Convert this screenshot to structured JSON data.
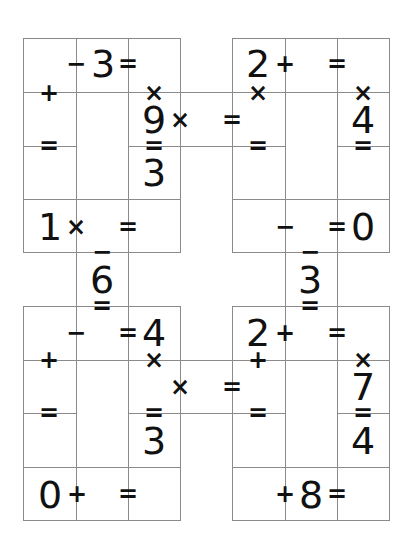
{
  "puzzle": {
    "type": "cross-math",
    "line_color": "#8a8a8a",
    "text_color": "#111111",
    "blocks": [
      {
        "name": "top-left",
        "glyphs": [
          {
            "t": "−",
            "x": 76,
            "y": 64,
            "k": "op"
          },
          {
            "t": "3",
            "x": 103,
            "y": 64,
            "k": "big"
          },
          {
            "t": "=",
            "x": 128,
            "y": 64,
            "k": "op"
          },
          {
            "t": "+",
            "x": 49,
            "y": 93,
            "k": "op"
          },
          {
            "t": "×",
            "x": 154,
            "y": 93,
            "k": "op"
          },
          {
            "t": "9",
            "x": 154,
            "y": 120,
            "k": "big"
          },
          {
            "t": "×",
            "x": 180,
            "y": 120,
            "k": "op"
          },
          {
            "t": "=",
            "x": 49,
            "y": 146,
            "k": "op"
          },
          {
            "t": "=",
            "x": 154,
            "y": 146,
            "k": "op"
          },
          {
            "t": "3",
            "x": 154,
            "y": 173,
            "k": "big"
          },
          {
            "t": "1",
            "x": 50,
            "y": 227,
            "k": "big"
          },
          {
            "t": "×",
            "x": 76,
            "y": 227,
            "k": "op"
          },
          {
            "t": "=",
            "x": 128,
            "y": 227,
            "k": "op"
          },
          {
            "t": "−",
            "x": 102,
            "y": 252,
            "k": "op"
          },
          {
            "t": "6",
            "x": 102,
            "y": 280,
            "k": "big"
          },
          {
            "t": "=",
            "x": 102,
            "y": 306,
            "k": "op"
          }
        ]
      },
      {
        "name": "top-right",
        "glyphs": [
          {
            "t": "=",
            "x": 232,
            "y": 120,
            "k": "op"
          },
          {
            "t": "2",
            "x": 258,
            "y": 64,
            "k": "big"
          },
          {
            "t": "+",
            "x": 285,
            "y": 64,
            "k": "op"
          },
          {
            "t": "=",
            "x": 337,
            "y": 64,
            "k": "op"
          },
          {
            "t": "×",
            "x": 258,
            "y": 93,
            "k": "op"
          },
          {
            "t": "×",
            "x": 363,
            "y": 93,
            "k": "op"
          },
          {
            "t": "4",
            "x": 363,
            "y": 120,
            "k": "big"
          },
          {
            "t": "=",
            "x": 258,
            "y": 146,
            "k": "op"
          },
          {
            "t": "=",
            "x": 363,
            "y": 146,
            "k": "op"
          },
          {
            "t": "−",
            "x": 285,
            "y": 227,
            "k": "op"
          },
          {
            "t": "=",
            "x": 337,
            "y": 227,
            "k": "op"
          },
          {
            "t": "0",
            "x": 363,
            "y": 227,
            "k": "big"
          },
          {
            "t": "−",
            "x": 310,
            "y": 252,
            "k": "op"
          },
          {
            "t": "3",
            "x": 310,
            "y": 280,
            "k": "big"
          },
          {
            "t": "=",
            "x": 310,
            "y": 306,
            "k": "op"
          }
        ]
      },
      {
        "name": "bottom-left",
        "glyphs": [
          {
            "t": "−",
            "x": 76,
            "y": 333,
            "k": "op"
          },
          {
            "t": "=",
            "x": 128,
            "y": 333,
            "k": "op"
          },
          {
            "t": "4",
            "x": 154,
            "y": 333,
            "k": "big"
          },
          {
            "t": "+",
            "x": 49,
            "y": 360,
            "k": "op"
          },
          {
            "t": "×",
            "x": 154,
            "y": 360,
            "k": "op"
          },
          {
            "t": "×",
            "x": 180,
            "y": 387,
            "k": "op"
          },
          {
            "t": "=",
            "x": 49,
            "y": 413,
            "k": "op"
          },
          {
            "t": "=",
            "x": 154,
            "y": 413,
            "k": "op"
          },
          {
            "t": "3",
            "x": 154,
            "y": 441,
            "k": "big"
          },
          {
            "t": "0",
            "x": 50,
            "y": 495,
            "k": "big"
          },
          {
            "t": "+",
            "x": 77,
            "y": 494,
            "k": "op"
          },
          {
            "t": "=",
            "x": 128,
            "y": 494,
            "k": "op"
          }
        ]
      },
      {
        "name": "bottom-right",
        "glyphs": [
          {
            "t": "=",
            "x": 232,
            "y": 387,
            "k": "op"
          },
          {
            "t": "2",
            "x": 258,
            "y": 333,
            "k": "big"
          },
          {
            "t": "+",
            "x": 285,
            "y": 333,
            "k": "op"
          },
          {
            "t": "=",
            "x": 337,
            "y": 333,
            "k": "op"
          },
          {
            "t": "+",
            "x": 258,
            "y": 360,
            "k": "op"
          },
          {
            "t": "×",
            "x": 363,
            "y": 360,
            "k": "op"
          },
          {
            "t": "7",
            "x": 363,
            "y": 387,
            "k": "big"
          },
          {
            "t": "=",
            "x": 258,
            "y": 413,
            "k": "op"
          },
          {
            "t": "=",
            "x": 363,
            "y": 413,
            "k": "op"
          },
          {
            "t": "4",
            "x": 363,
            "y": 441,
            "k": "big"
          },
          {
            "t": "+",
            "x": 285,
            "y": 494,
            "k": "op"
          },
          {
            "t": "8",
            "x": 311,
            "y": 495,
            "k": "big"
          },
          {
            "t": "=",
            "x": 337,
            "y": 494,
            "k": "op"
          }
        ]
      }
    ],
    "lines": {
      "h": [
        [
          23,
          38,
          157
        ],
        [
          23,
          92,
          157
        ],
        [
          23,
          199,
          157
        ],
        [
          23,
          252,
          157
        ],
        [
          23,
          146,
          53
        ],
        [
          128,
          146,
          52
        ],
        [
          232,
          38,
          157
        ],
        [
          232,
          92,
          157
        ],
        [
          232,
          199,
          157
        ],
        [
          232,
          252,
          157
        ],
        [
          232,
          146,
          53
        ],
        [
          337,
          146,
          52
        ],
        [
          180,
          92,
          52
        ],
        [
          180,
          146,
          52
        ],
        [
          23,
          306,
          157
        ],
        [
          23,
          360,
          157
        ],
        [
          23,
          467,
          157
        ],
        [
          23,
          520,
          157
        ],
        [
          23,
          413,
          53
        ],
        [
          128,
          413,
          52
        ],
        [
          232,
          306,
          157
        ],
        [
          232,
          360,
          157
        ],
        [
          232,
          467,
          157
        ],
        [
          232,
          520,
          157
        ],
        [
          232,
          413,
          53
        ],
        [
          337,
          413,
          52
        ],
        [
          180,
          360,
          52
        ],
        [
          180,
          413,
          52
        ]
      ],
      "v": [
        [
          23,
          38,
          214
        ],
        [
          76,
          38,
          482
        ],
        [
          128,
          38,
          482
        ],
        [
          180,
          38,
          214
        ],
        [
          232,
          38,
          214
        ],
        [
          285,
          38,
          482
        ],
        [
          337,
          38,
          482
        ],
        [
          389,
          38,
          214
        ],
        [
          23,
          306,
          214
        ],
        [
          180,
          306,
          214
        ],
        [
          232,
          306,
          214
        ],
        [
          389,
          306,
          214
        ]
      ]
    }
  }
}
